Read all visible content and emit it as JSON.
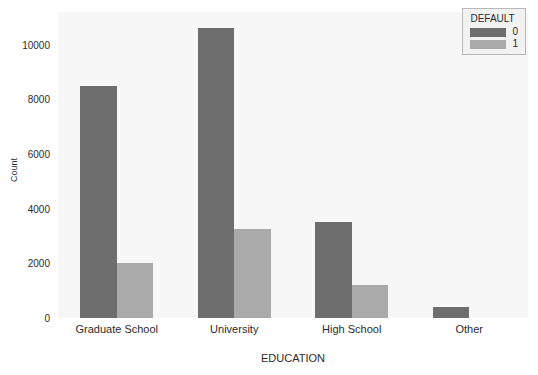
{
  "chart_data": {
    "type": "bar",
    "title": "",
    "subtitle": "",
    "xlabel": "EDUCATION",
    "ylabel": "Count",
    "categories": [
      "Graduate School",
      "University",
      "High School",
      "Other"
    ],
    "series": [
      {
        "name": "0",
        "values": [
          8500,
          10600,
          3500,
          400
        ],
        "color": "#6e6e6e"
      },
      {
        "name": "1",
        "values": [
          2000,
          3270,
          1200,
          0
        ],
        "color": "#aaaaaa"
      }
    ],
    "legend": {
      "title": "DEFAULT",
      "position": "top-right",
      "entries": [
        "0",
        "1"
      ]
    },
    "yticks": [
      0,
      2000,
      4000,
      6000,
      8000,
      10000
    ],
    "ytick_labels": [
      "0",
      "2000",
      "4000",
      "6000",
      "8000",
      "10000"
    ],
    "ylim": [
      0,
      11200
    ],
    "grid": false,
    "plot_background": "#f7f7f7",
    "figure_background": "#ffffff"
  }
}
